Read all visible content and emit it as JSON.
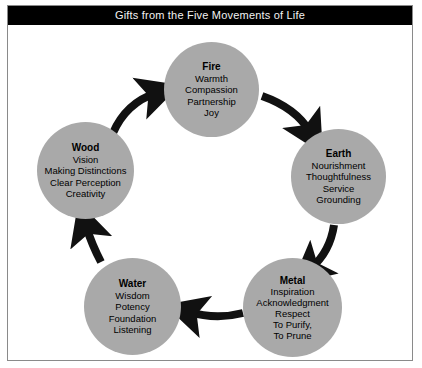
{
  "header": {
    "title": "Gifts from the Five Movements of Life"
  },
  "colors": {
    "title_bar_bg": "#000000",
    "title_text": "#ffffff",
    "circle_fill": "#a9a9a9",
    "arrow": "#111111",
    "frame_border": "#8a8a8a",
    "page_bg": "#ffffff"
  },
  "diagram": {
    "type": "cycle",
    "direction": "clockwise",
    "nodes": [
      {
        "id": "fire",
        "title": "Fire",
        "items": [
          "Warmth",
          "Compassion",
          "Partnership",
          "Joy"
        ]
      },
      {
        "id": "earth",
        "title": "Earth",
        "items": [
          "Nourishment",
          "Thoughtfulness",
          "Service",
          "Grounding"
        ]
      },
      {
        "id": "metal",
        "title": "Metal",
        "items": [
          "Inspiration",
          "Acknowledgment",
          "Respect",
          "To Purify,",
          "To Prune"
        ]
      },
      {
        "id": "water",
        "title": "Water",
        "items": [
          "Wisdom",
          "Potency",
          "Foundation",
          "Listening"
        ]
      },
      {
        "id": "wood",
        "title": "Wood",
        "items": [
          "Vision",
          "Making Distinctions",
          "Clear Perception",
          "Creativity"
        ]
      }
    ],
    "arrows": [
      {
        "id": "wood-to-fire",
        "from": "wood",
        "to": "fire"
      },
      {
        "id": "fire-to-earth",
        "from": "fire",
        "to": "earth"
      },
      {
        "id": "earth-to-metal",
        "from": "earth",
        "to": "metal"
      },
      {
        "id": "metal-to-water",
        "from": "metal",
        "to": "water"
      },
      {
        "id": "water-to-wood",
        "from": "water",
        "to": "wood"
      }
    ]
  }
}
